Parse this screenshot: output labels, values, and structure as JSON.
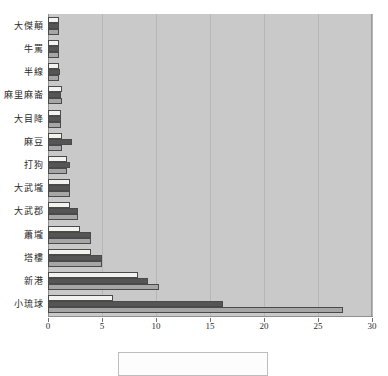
{
  "chart_data": {
    "type": "bar",
    "orientation": "horizontal",
    "title": "",
    "xlabel": "",
    "ylabel": "",
    "xlim": [
      0,
      30
    ],
    "xticks": [
      0,
      5,
      10,
      15,
      20,
      25,
      30
    ],
    "xtick_labels": [
      "0",
      "5",
      "10",
      "15",
      "20",
      "25",
      "30"
    ],
    "grid": true,
    "grid_axis": "x",
    "legend_position": "bottom",
    "categories": [
      "大傑顛",
      "牛罵",
      "半線",
      "麻里麻崙",
      "大目降",
      "麻豆",
      "打狗",
      "大武壠",
      "大武郡",
      "蕭壠",
      "塔樓",
      "新港",
      "小琉球"
    ],
    "series": [
      {
        "name": "series-1",
        "color": "#f2f2ef",
        "values": [
          1,
          1,
          1,
          1.3,
          1.2,
          1.3,
          1.8,
          2,
          2,
          3,
          4,
          8.3,
          6
        ]
      },
      {
        "name": "series-2",
        "color": "#555555",
        "values": [
          1,
          1,
          1.1,
          1.2,
          1.2,
          2.2,
          2,
          2,
          2.8,
          4,
          5,
          9.3,
          16.2
        ]
      },
      {
        "name": "series-3",
        "color": "#a6a6a6",
        "values": [
          1,
          1,
          1,
          1.3,
          1.2,
          1.3,
          1.8,
          2,
          2.8,
          4,
          5,
          10.3,
          27.3
        ]
      }
    ]
  },
  "legend": {
    "entries": []
  }
}
